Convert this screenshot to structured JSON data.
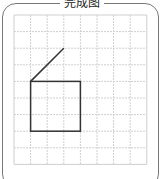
{
  "title": "完成图",
  "grid": {
    "cols": 8,
    "rows": 9,
    "left": 14,
    "top": 15,
    "cell": 16.6,
    "line_color": "#cfcfcf"
  },
  "shape": {
    "color": "#333333",
    "square": {
      "col": 1,
      "row": 4,
      "size": 3
    },
    "diagonal": {
      "from": [
        1,
        4
      ],
      "to": [
        3,
        2
      ]
    }
  }
}
